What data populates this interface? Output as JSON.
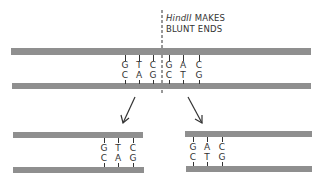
{
  "annotation": {
    "enzyme": "HindII",
    "line1_rest": " MAKES",
    "line2": "BLUNT ENDS"
  },
  "uncut_dna": {
    "top_strand_bases": [
      "G",
      "T",
      "C",
      "G",
      "A",
      "C"
    ],
    "bottom_strand_bases": [
      "C",
      "A",
      "G",
      "C",
      "T",
      "G"
    ]
  },
  "left_fragment": {
    "top_strand_bases": [
      "G",
      "T",
      "C"
    ],
    "bottom_strand_bases": [
      "C",
      "A",
      "G"
    ]
  },
  "right_fragment": {
    "top_strand_bases": [
      "G",
      "A",
      "C"
    ],
    "bottom_strand_bases": [
      "C",
      "T",
      "G"
    ]
  },
  "colors": {
    "strand": "#8f8f8f",
    "ink": "#333333"
  }
}
